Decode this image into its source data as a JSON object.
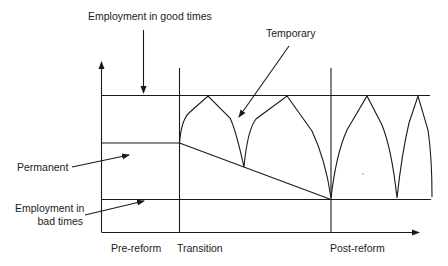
{
  "diagram": {
    "title": "",
    "labels": {
      "good_times": "Employment in good times",
      "temporary": "Temporary",
      "permanent": "Permanent",
      "bad_times_line1": "Employment in",
      "bad_times_line2": "bad times"
    },
    "x_axis": {
      "phases": [
        "Pre-reform",
        "Transition",
        "Post-reform"
      ]
    },
    "colors": {
      "line": "#1a1a1a",
      "background": "#ffffff"
    }
  }
}
